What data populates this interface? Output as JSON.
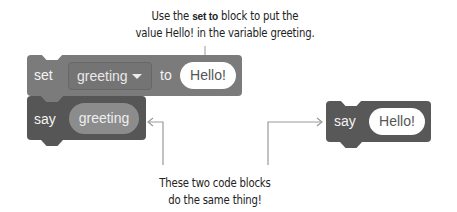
{
  "annotations": {
    "top_note": {
      "line1_pre": "Use the ",
      "line1_bold": "set to",
      "line1_post": " block to put the",
      "line2": "value Hello! in the variable greeting."
    },
    "bottom_note": {
      "line1": "These two code blocks",
      "line2": "do the same thing!"
    }
  },
  "left_script": {
    "set_block": {
      "keyword": "set",
      "variable_dropdown": "greeting",
      "connector": "to",
      "value": "Hello!"
    },
    "say_block": {
      "keyword": "say",
      "reporter": "greeting"
    }
  },
  "right_script": {
    "say_block": {
      "keyword": "say",
      "value": "Hello!"
    }
  },
  "colors": {
    "set_block": "#7b7b7b",
    "say_block": "#565656",
    "reporter": "#8c8c8c",
    "connector_line": "#999999"
  }
}
